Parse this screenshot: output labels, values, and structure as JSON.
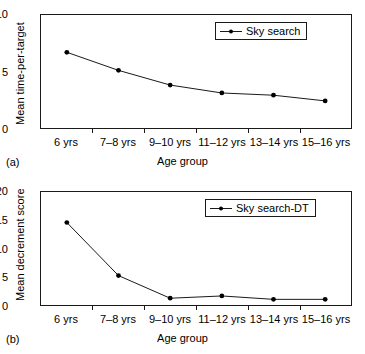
{
  "figure": {
    "panels": [
      {
        "tag": "(a)",
        "legend_label": "Sky search",
        "ylabel": "Mean time-per-target",
        "xlabel": "Age group"
      },
      {
        "tag": "(b)",
        "legend_label": "Sky search-DT",
        "ylabel": "Mean decrement score",
        "xlabel": "Age group"
      }
    ],
    "line_color": "#1a1a1a",
    "marker_color": "#000000"
  },
  "chart_data": [
    {
      "type": "line",
      "title": "",
      "panel": "(a)",
      "categories": [
        "6 yrs",
        "7–8 yrs",
        "9–10 yrs",
        "11–12 yrs",
        "13–14 yrs",
        "15–16 yrs"
      ],
      "series": [
        {
          "name": "Sky search",
          "values": [
            6.7,
            5.1,
            3.8,
            3.1,
            2.9,
            2.4
          ]
        }
      ],
      "xlabel": "Age group",
      "ylabel": "Mean time-per-target",
      "ylim": [
        0,
        10
      ],
      "yticks": [
        0,
        5,
        10
      ],
      "grid": false,
      "legend_position": "top-right"
    },
    {
      "type": "line",
      "title": "",
      "panel": "(b)",
      "categories": [
        "6 yrs",
        "7–8 yrs",
        "9–10 yrs",
        "11–12 yrs",
        "13–14 yrs",
        "15–16 yrs"
      ],
      "series": [
        {
          "name": "Sky search-DT",
          "values": [
            14.6,
            5.2,
            1.2,
            1.6,
            1.0,
            1.0
          ]
        }
      ],
      "xlabel": "Age group",
      "ylabel": "Mean decrement score",
      "ylim": [
        0,
        20
      ],
      "yticks": [
        0,
        5,
        10,
        15,
        20
      ],
      "grid": false,
      "legend_position": "top-right"
    }
  ]
}
